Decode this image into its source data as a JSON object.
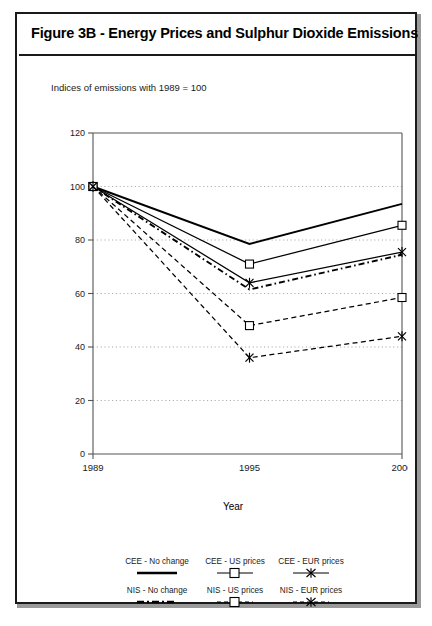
{
  "figure": {
    "title": "Figure 3B - Energy Prices and Sulphur Dioxide Emissions",
    "subtitle": "Indices of emissions with 1989 = 100"
  },
  "chart_data": {
    "type": "line",
    "title": "Figure 3B - Energy Prices and Sulphur Dioxide Emissions",
    "subtitle": "Indices of emissions with 1989 = 100",
    "xlabel": "Year",
    "ylabel": "",
    "x": [
      "1989",
      "1995",
      "2000"
    ],
    "xtick_labels": [
      "1989",
      "1995",
      "2000"
    ],
    "ytick_labels": [
      "0",
      "20",
      "40",
      "60",
      "80",
      "100",
      "120"
    ],
    "ylim": [
      0,
      120
    ],
    "ytick_step": 20,
    "grid": "horizontal-dotted",
    "legend_position": "below-axes",
    "series": [
      {
        "name": "CEE - No change",
        "values": [
          100,
          78.5,
          93.5
        ],
        "line": "solid",
        "width": "thick",
        "marker": "none"
      },
      {
        "name": "CEE - US prices",
        "values": [
          100,
          71.0,
          85.5
        ],
        "line": "solid",
        "width": "thin",
        "marker": "square"
      },
      {
        "name": "CEE - EUR prices",
        "values": [
          100,
          64.0,
          75.5
        ],
        "line": "solid",
        "width": "thin",
        "marker": "star"
      },
      {
        "name": "NIS - No change",
        "values": [
          100,
          61.5,
          74.5
        ],
        "line": "dashdot",
        "width": "thick",
        "marker": "none"
      },
      {
        "name": "NIS - US prices",
        "values": [
          100,
          48.0,
          58.5
        ],
        "line": "dashed",
        "width": "thin",
        "marker": "square"
      },
      {
        "name": "NIS - EUR prices",
        "values": [
          100,
          36.0,
          44.0
        ],
        "line": "dashed",
        "width": "thin",
        "marker": "star"
      }
    ]
  },
  "legend": {
    "entries": [
      {
        "label": "CEE - No change",
        "marker": "line-thick"
      },
      {
        "label": "CEE - US prices",
        "marker": "square"
      },
      {
        "label": "CEE - EUR prices",
        "marker": "star"
      },
      {
        "label": "NIS - No change",
        "marker": "line-dashdot"
      },
      {
        "label": "NIS - US prices",
        "marker": "square-dashed"
      },
      {
        "label": "NIS - EUR prices",
        "marker": "star-dashed"
      }
    ]
  },
  "axis": {
    "x_title": "Year"
  },
  "colors": {
    "ink": "#000000",
    "grid": "#9b9b9b",
    "frame": "#1a1a1a"
  }
}
